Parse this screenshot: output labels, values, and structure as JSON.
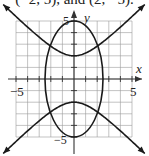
{
  "caption": "(−2, 5), and (2, −5).",
  "chart_data": {
    "type": "line",
    "title": "",
    "xlabel": "x",
    "ylabel": "y",
    "xlim": [
      -5,
      5
    ],
    "ylim": [
      -5,
      5
    ],
    "grid": true,
    "tick_labels": {
      "x": [
        "-5",
        "5"
      ],
      "y": [
        "5",
        "-5"
      ]
    },
    "series": [
      {
        "name": "ellipse",
        "equation": "x^2/6.25 + y^2/25 = 1",
        "vertices": [
          [
            0,
            5
          ],
          [
            0,
            -5
          ],
          [
            -2.5,
            0
          ],
          [
            2.5,
            0
          ]
        ]
      },
      {
        "name": "hyperbola",
        "equation": "y^2/4 - x^2/4 = 1",
        "vertices": [
          [
            0,
            2
          ],
          [
            0,
            -2
          ]
        ],
        "asymptote_slopes": [
          1,
          -1
        ]
      }
    ],
    "intersections": [
      [
        -1.83,
        2.72
      ],
      [
        1.83,
        2.72
      ],
      [
        -1.83,
        -2.72
      ],
      [
        1.83,
        -2.72
      ]
    ]
  },
  "labels": {
    "x_axis": "x",
    "y_axis": "y",
    "x_min": "−5",
    "x_max": "5",
    "y_max": "5",
    "y_min": "−5"
  },
  "colors": {
    "grid": "#9a9a9a",
    "axis": "#333333",
    "curve": "#1a1a1a"
  }
}
